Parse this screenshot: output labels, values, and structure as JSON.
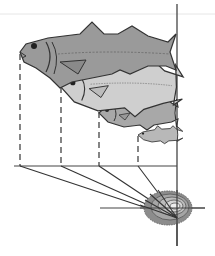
{
  "diagram": {
    "title": "",
    "fish": [
      {
        "label": "fish-age-4",
        "snout_x": 20,
        "color": "#9a9a9a"
      },
      {
        "label": "fish-age-3",
        "snout_x": 61,
        "color": "#c8c8c8"
      },
      {
        "label": "fish-age-2",
        "snout_x": 99,
        "color": "#a8a8a8"
      },
      {
        "label": "fish-age-1",
        "snout_x": 138,
        "color": "#b8b8b8"
      }
    ],
    "otolith": {
      "rings": 5,
      "color": "#8c8c8c"
    },
    "colors": {
      "line": "#333333",
      "fill_dark": "#8f8f8f",
      "fill_light": "#cfcfcf"
    }
  }
}
